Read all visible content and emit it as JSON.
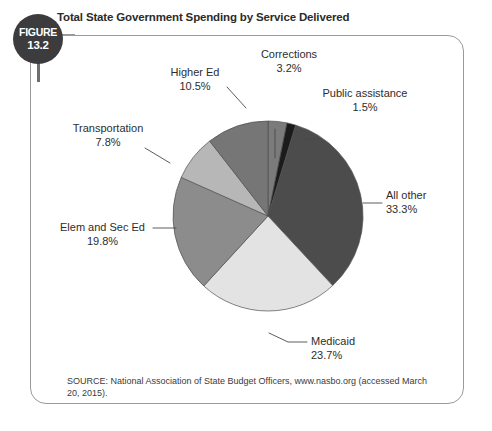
{
  "figure": {
    "badge_word": "FIGURE",
    "badge_number": "13.2",
    "title": "Total State Government Spending by Service Delivered",
    "source": "SOURCE: National Association of State Budget Officers, www.nasbo.org (accessed March 20, 2015)."
  },
  "chart_data": {
    "type": "pie",
    "title": "Total State Government Spending by Service Delivered",
    "xlabel": "",
    "ylabel": "",
    "legend": "none",
    "grid": false,
    "units": "percent",
    "start_angle_deg": 0,
    "direction": "clockwise",
    "categories": [
      "Corrections",
      "Public assistance",
      "All other",
      "Medicaid",
      "Elem and Sec Ed",
      "Transportation",
      "Higher Ed"
    ],
    "values": [
      3.2,
      1.5,
      33.3,
      23.7,
      19.8,
      7.8,
      10.5
    ],
    "colors": [
      "#7b7b7b",
      "#1b1b1b",
      "#4c4c4c",
      "#e3e3e3",
      "#8c8c8c",
      "#b7b7b7",
      "#767676"
    ],
    "slices": [
      {
        "label": "Corrections",
        "value": 3.2,
        "value_text": "3.2%",
        "color": "#7b7b7b"
      },
      {
        "label": "Public assistance",
        "value": 1.5,
        "value_text": "1.5%",
        "color": "#1b1b1b"
      },
      {
        "label": "All other",
        "value": 33.3,
        "value_text": "33.3%",
        "color": "#4c4c4c"
      },
      {
        "label": "Medicaid",
        "value": 23.7,
        "value_text": "23.7%",
        "color": "#e3e3e3"
      },
      {
        "label": "Elem and Sec Ed",
        "value": 19.8,
        "value_text": "19.8%",
        "color": "#8c8c8c"
      },
      {
        "label": "Transportation",
        "value": 7.8,
        "value_text": "7.8%",
        "color": "#b7b7b7"
      },
      {
        "label": "Higher Ed",
        "value": 10.5,
        "value_text": "10.5%",
        "color": "#767676"
      }
    ]
  },
  "labels": {
    "corrections": {
      "name": "Corrections",
      "pct": "3.2%"
    },
    "public_assistance": {
      "name": "Public assistance",
      "pct": "1.5%"
    },
    "all_other": {
      "name": "All other",
      "pct": "33.3%"
    },
    "medicaid": {
      "name": "Medicaid",
      "pct": "23.7%"
    },
    "elem_sec_ed": {
      "name": "Elem and Sec Ed",
      "pct": "19.8%"
    },
    "transportation": {
      "name": "Transportation",
      "pct": "7.8%"
    },
    "higher_ed": {
      "name": "Higher Ed",
      "pct": "10.5%"
    }
  },
  "theme": {
    "frame_border": "#9a9a9c",
    "badge_bg": "#3c3c3e",
    "text": "#2d2d2d",
    "leader_line": "#4a4a4a"
  }
}
